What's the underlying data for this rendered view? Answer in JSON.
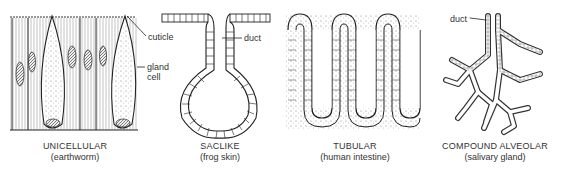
{
  "figure": {
    "panels": [
      {
        "id": "unicellular",
        "title": "UNICELLULAR",
        "subtitle": "(earthworm)",
        "labels": [
          "cuticle",
          "gland cell"
        ]
      },
      {
        "id": "saclike",
        "title": "SACLIKE",
        "subtitle": "(frog skin)",
        "labels": [
          "duct"
        ]
      },
      {
        "id": "tubular",
        "title": "TUBULAR",
        "subtitle": "(human intestine)",
        "labels": []
      },
      {
        "id": "compound-alveolar",
        "title": "COMPOUND ALVEOLAR",
        "subtitle": "(salivary gland)",
        "labels": [
          "duct"
        ]
      }
    ],
    "annotations": {
      "cuticle": "cuticle",
      "gland_line1": "gland",
      "gland_line2": "cell",
      "duct_saclike": "duct",
      "duct_compound": "duct"
    }
  }
}
